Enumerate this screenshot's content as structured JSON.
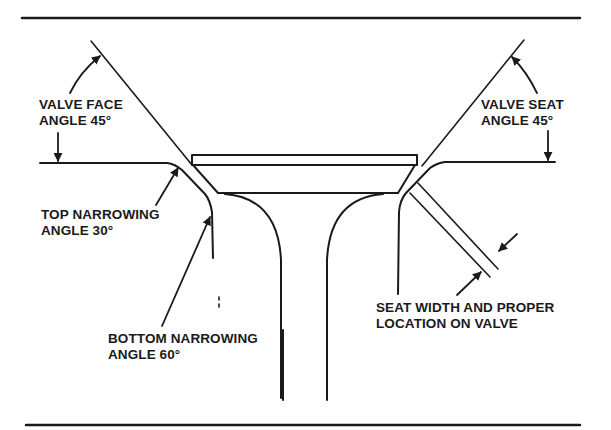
{
  "diagram": {
    "labels": {
      "valve_face": {
        "line1": "VALVE FACE",
        "line2": "ANGLE 45°"
      },
      "valve_seat": {
        "line1": "VALVE SEAT",
        "line2": "ANGLE 45°"
      },
      "top_narrowing": {
        "line1": "TOP NARROWING",
        "line2": "ANGLE 30°"
      },
      "bottom_narrowing": {
        "line1": "BOTTOM NARROWING",
        "line2": "ANGLE 60°"
      },
      "seat_width": {
        "line1": "SEAT WIDTH AND PROPER",
        "line2": "LOCATION ON VALVE"
      }
    },
    "colors": {
      "ink": "#1a1a1a",
      "background": "#ffffff"
    }
  }
}
